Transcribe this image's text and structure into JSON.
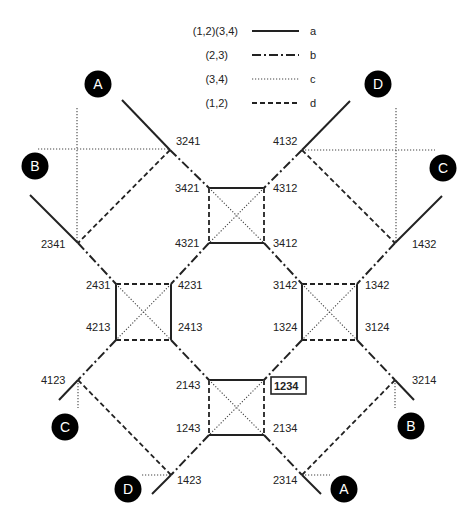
{
  "legend": [
    {
      "label": "(1,2)(3,4)",
      "style": "a",
      "letter": "a"
    },
    {
      "label": "(2,3)",
      "style": "b",
      "letter": "b"
    },
    {
      "label": "(3,4)",
      "style": "c",
      "letter": "c"
    },
    {
      "label": "(1,2)",
      "style": "d",
      "letter": "d"
    }
  ],
  "identity": "1234",
  "squares": [
    {
      "name": "top",
      "corners": {
        "tl": "3421",
        "tr": "4312",
        "bl": "4321",
        "br": "3412"
      }
    },
    {
      "name": "left",
      "corners": {
        "tl": "2431",
        "tr": "4231",
        "bl": "4213",
        "br": "2413"
      }
    },
    {
      "name": "right",
      "corners": {
        "tl": "3142",
        "tr": "1342",
        "bl": "1324",
        "br": "3124"
      }
    },
    {
      "name": "bottom",
      "corners": {
        "tl": "2143",
        "tr": "1234",
        "bl": "1243",
        "br": "2134"
      }
    }
  ],
  "outer_nodes": [
    {
      "label": "3241",
      "endpoint": "A"
    },
    {
      "label": "2341",
      "endpoint": "B"
    },
    {
      "label": "4132",
      "endpoint": "D"
    },
    {
      "label": "1432",
      "endpoint": "C"
    },
    {
      "label": "4123",
      "endpoint": "C"
    },
    {
      "label": "1423",
      "endpoint": "D"
    },
    {
      "label": "3214",
      "endpoint": "B"
    },
    {
      "label": "2314",
      "endpoint": "A"
    }
  ],
  "endpoints": {
    "A_top": "A",
    "B_left": "B",
    "D_top": "D",
    "C_right": "C",
    "C_bottom": "C",
    "D_bottom": "D",
    "B_bottom": "B",
    "A_bottom": "A"
  },
  "colors": {
    "line": "#222222",
    "circle_fill": "#000000",
    "circle_text": "#ffffff",
    "background": "#ffffff"
  }
}
